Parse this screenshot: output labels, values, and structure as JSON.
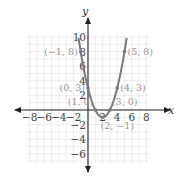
{
  "chart_data": {
    "type": "line",
    "title": "",
    "xlabel": "x",
    "ylabel": "y",
    "xlim": [
      -8,
      8
    ],
    "ylim": [
      -6,
      10
    ],
    "grid": true,
    "x_ticks": [
      -8,
      -6,
      -4,
      -2,
      2,
      4,
      6,
      8
    ],
    "x_tick_labels": [
      "−8",
      "−6",
      "−4",
      "−2",
      "2",
      "4",
      "6",
      "8"
    ],
    "y_ticks": [
      10,
      8,
      6,
      4,
      2,
      -2,
      -4,
      -6
    ],
    "y_tick_labels": [
      "10",
      "8",
      "6",
      "4",
      "2",
      "−2",
      "−4",
      "−6"
    ],
    "series": [
      {
        "name": "y = x^2 - 4x + 3",
        "color": "#7a7a7a",
        "x_range": [
          -1.3,
          5.3
        ],
        "coefficients": {
          "a": 1,
          "b": -4,
          "c": 3
        }
      }
    ],
    "points": [
      {
        "x": -1,
        "y": 8,
        "label": "(−1, 8)"
      },
      {
        "x": 0,
        "y": 3,
        "label": "(0, 3)"
      },
      {
        "x": 1,
        "y": 0,
        "label": "(1, 0)"
      },
      {
        "x": 2,
        "y": -1,
        "label": "(2, −1)"
      },
      {
        "x": 3,
        "y": 0,
        "label": "(3, 0)"
      },
      {
        "x": 4,
        "y": 3,
        "label": "(4, 3)"
      },
      {
        "x": 5,
        "y": 8,
        "label": "(5, 8)"
      }
    ]
  },
  "colors": {
    "axis": "#222222",
    "grid": "#c8c8c8",
    "curve": "#7a7a7a",
    "point": "#7a7a7a",
    "label": "#9a9a9a"
  }
}
